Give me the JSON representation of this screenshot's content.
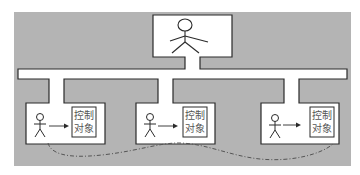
{
  "colors": {
    "background": "#ffffff",
    "panel_gray": "#b4b4b4",
    "box_fill": "#ffffff",
    "stroke": "#2a2a2a",
    "dashed_line": "#555555",
    "text": "#555555"
  },
  "top_node": {
    "role": "supervisor",
    "icon": "stick-figure-icon"
  },
  "subsystems": [
    {
      "operator_icon": "stick-figure-icon",
      "arrow": "arrow-right-icon",
      "control_object": {
        "line1": "控制",
        "line2": "对象"
      }
    },
    {
      "operator_icon": "stick-figure-icon",
      "arrow": "arrow-right-icon",
      "control_object": {
        "line1": "控制",
        "line2": "对象"
      }
    },
    {
      "operator_icon": "stick-figure-icon",
      "arrow": "arrow-right-icon",
      "control_object": {
        "line1": "控制",
        "line2": "对象"
      }
    }
  ],
  "links": {
    "dashed_curve": "dash-dot link connecting the three operators"
  }
}
